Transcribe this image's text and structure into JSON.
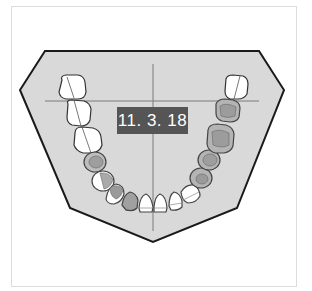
{
  "diagram": {
    "type": "dental-arch-chart",
    "arch": "mandibular",
    "date_label": "11. 3. 18",
    "colors": {
      "background": "#ffffff",
      "frame_border": "#dcdcdc",
      "arch_fill": "#d9d9d9",
      "arch_outline": "#1a1a1a",
      "guide_lines": "#7a7a7a",
      "tooth_healthy": "#ffffff",
      "tooth_treated": "#a6a6a6",
      "tooth_outline": "#444444",
      "label_bg": "#555555",
      "label_text": "#ffffff"
    },
    "teeth": {
      "patient_right": [
        {
          "position": "third-molar",
          "state": "unmarked"
        },
        {
          "position": "second-molar",
          "state": "unmarked"
        },
        {
          "position": "first-molar",
          "state": "unmarked"
        },
        {
          "position": "second-premolar",
          "state": "treated"
        },
        {
          "position": "first-premolar",
          "state": "partially-treated"
        },
        {
          "position": "canine",
          "state": "treated"
        },
        {
          "position": "lateral-incisor",
          "state": "treated"
        },
        {
          "position": "central-incisor",
          "state": "unmarked"
        }
      ],
      "patient_left": [
        {
          "position": "central-incisor",
          "state": "unmarked"
        },
        {
          "position": "lateral-incisor",
          "state": "unmarked"
        },
        {
          "position": "canine",
          "state": "unmarked"
        },
        {
          "position": "first-premolar",
          "state": "treated"
        },
        {
          "position": "second-premolar",
          "state": "treated"
        },
        {
          "position": "first-molar",
          "state": "treated"
        },
        {
          "position": "second-molar",
          "state": "treated"
        },
        {
          "position": "third-molar",
          "state": "unmarked"
        }
      ]
    }
  }
}
